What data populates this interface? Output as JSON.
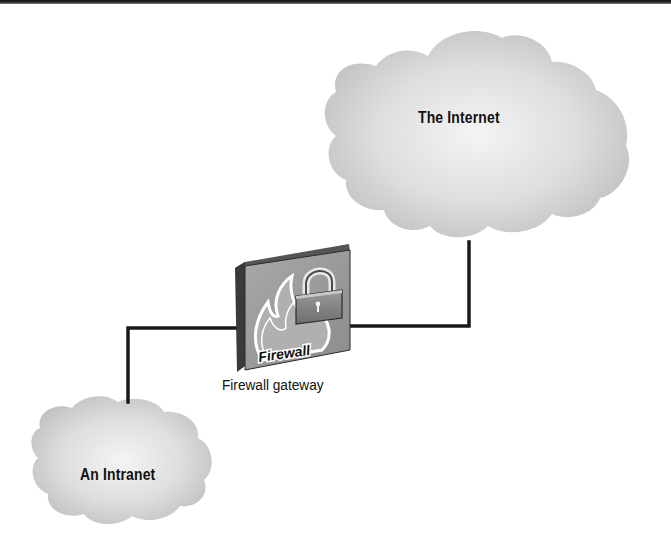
{
  "diagram": {
    "nodes": [
      {
        "id": "internet",
        "type": "cloud",
        "label": "The Internet"
      },
      {
        "id": "firewall",
        "type": "firewall-device",
        "label": "Firewall gateway",
        "device_text": "Firewall"
      },
      {
        "id": "intranet",
        "type": "cloud",
        "label": "An Intranet"
      }
    ],
    "edges": [
      {
        "from": "intranet",
        "to": "firewall"
      },
      {
        "from": "firewall",
        "to": "internet"
      }
    ]
  },
  "labels": {
    "internet": "The Internet",
    "intranet": "An Intranet",
    "gateway": "Firewall gateway",
    "device_text": "Firewall"
  },
  "colors": {
    "cloud_fill": "#cfcfcf",
    "cloud_highlight": "#f2f2f2",
    "line": "#1a1a1a",
    "box_front": "#9a9a9a",
    "box_side": "#3a3a3a",
    "box_top": "#5a5a5a"
  },
  "icons": {
    "lock": "padlock-icon",
    "flame": "flame-icon"
  }
}
